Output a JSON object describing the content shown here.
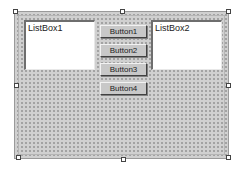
{
  "form": {
    "name": "form-designer-surface",
    "colors": {
      "background": "#d0d0d0",
      "grid_dot": "#8a8a8a",
      "border": "#9a9a9a"
    }
  },
  "listboxes": [
    {
      "label": "ListBox1"
    },
    {
      "label": "ListBox2"
    }
  ],
  "buttons": [
    {
      "label": "Button1"
    },
    {
      "label": "Button2"
    },
    {
      "label": "Button3"
    },
    {
      "label": "Button4"
    }
  ],
  "selection_handles": [
    "top-left",
    "top-center",
    "top-right",
    "middle-left",
    "middle-right",
    "bottom-left",
    "bottom-center",
    "bottom-right"
  ]
}
